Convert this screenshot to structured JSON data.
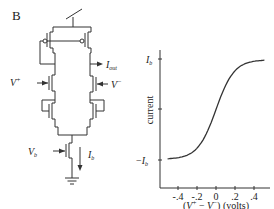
{
  "figure": {
    "panel_label": "B"
  },
  "circuit": {
    "labels": {
      "v_plus": "V",
      "v_plus_sup": "+",
      "v_minus": "V",
      "v_minus_sup": "−",
      "i_out": "I",
      "i_out_sub": "out",
      "v_b": "V",
      "v_b_sub": "b",
      "i_b": "I",
      "i_b_sub": "b"
    },
    "components": [
      "pmos-current-mirror",
      "nmos-differential-pair",
      "nmos-bias-transistor",
      "ground"
    ]
  },
  "chart_data": {
    "type": "line",
    "title": "",
    "xlabel": "(V⁺ − V⁻) (volts)",
    "ylabel": "current",
    "x_ticks": [
      "-.4",
      "-.2",
      "0",
      ".2",
      ".4"
    ],
    "y_ticks": [
      "−I_b",
      "0",
      "I_b"
    ],
    "xlim": [
      -0.5,
      0.5
    ],
    "ylim": [
      -1.0,
      1.0
    ],
    "grid": false,
    "legend": null,
    "series": [
      {
        "name": "I_out (tanh)",
        "x": [
          -0.5,
          -0.4,
          -0.3,
          -0.2,
          -0.1,
          0.0,
          0.1,
          0.2,
          0.3,
          0.4,
          0.5
        ],
        "y": [
          -0.98,
          -0.96,
          -0.9,
          -0.76,
          -0.46,
          0.0,
          0.46,
          0.76,
          0.9,
          0.96,
          0.98
        ]
      }
    ]
  },
  "chart_text": {
    "ylabel": "current",
    "ytick_top": "I",
    "ytick_top_sub": "b",
    "ytick_bottom_minus": "−",
    "ytick_bottom": "I",
    "ytick_bottom_sub": "b",
    "xtick_0": "-.4",
    "xtick_1": "-.2",
    "xtick_2": "0",
    "xtick_3": ".2",
    "xtick_4": ".4",
    "xlabel_open": "(",
    "xlabel_v1": "V",
    "xlabel_sup1": "+",
    "xlabel_minus": " − ",
    "xlabel_v2": "V",
    "xlabel_sup2": "−",
    "xlabel_close": ") (volts)"
  }
}
